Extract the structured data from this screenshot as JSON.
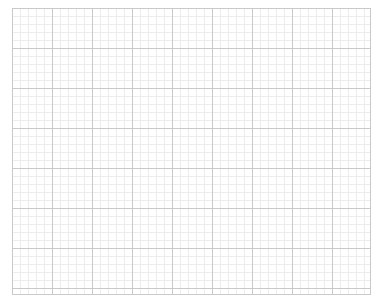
{
  "graph_paper": {
    "origin": [
      12,
      8
    ],
    "size": [
      358,
      286
    ],
    "major_spacing_px": 40,
    "minor_spacing_px": 8,
    "colors": {
      "background": "#ffffff",
      "major_line": "#c9c9c9",
      "minor_line": "#ececec"
    }
  }
}
